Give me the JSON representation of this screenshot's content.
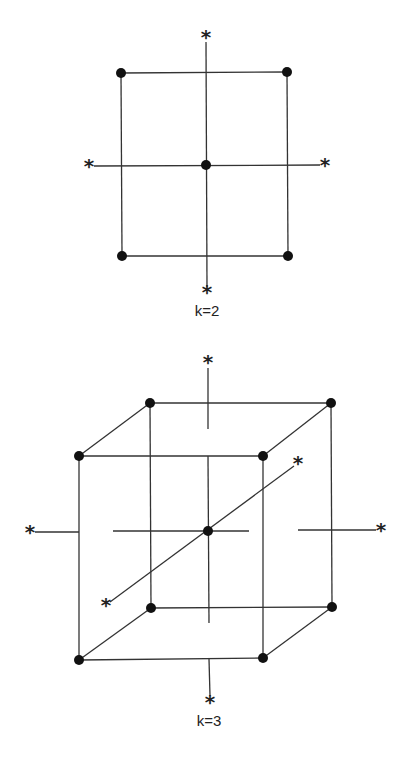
{
  "figure": {
    "colors": {
      "line": "#333333",
      "point": "#111111",
      "background": "#ffffff"
    },
    "panels": [
      {
        "id": "k2",
        "label": "k=2",
        "label_pos": [
          207,
          316
        ],
        "factorial_points": [
          [
            121,
            73
          ],
          [
            287,
            72
          ],
          [
            122,
            256
          ],
          [
            288,
            256
          ]
        ],
        "center_point": [
          206,
          165
        ],
        "axial_points": [
          [
            206,
            37
          ],
          [
            207,
            292
          ],
          [
            89,
            166
          ],
          [
            325,
            165
          ]
        ],
        "edges": [
          [
            [
              121,
              73
            ],
            [
              287,
              72
            ]
          ],
          [
            [
              287,
              72
            ],
            [
              288,
              256
            ]
          ],
          [
            [
              288,
              256
            ],
            [
              122,
              256
            ]
          ],
          [
            [
              122,
              256
            ],
            [
              121,
              73
            ]
          ],
          [
            [
              206,
              42
            ],
            [
              207,
              287
            ]
          ],
          [
            [
              94,
              166
            ],
            [
              320,
              165
            ]
          ]
        ]
      },
      {
        "id": "k3",
        "label": "k=3",
        "label_pos": [
          209,
          726
        ],
        "factorial_points": [
          [
            150,
            403
          ],
          [
            331,
            403
          ],
          [
            151,
            608
          ],
          [
            332,
            607
          ],
          [
            79,
            456
          ],
          [
            263,
            456
          ],
          [
            79,
            660
          ],
          [
            263,
            658
          ]
        ],
        "center_point": [
          208,
          531
        ],
        "axial_points": [
          [
            208,
            362
          ],
          [
            210,
            702
          ],
          [
            30,
            532
          ],
          [
            381,
            530
          ],
          [
            298,
            463
          ],
          [
            106,
            605
          ]
        ],
        "edges": [
          [
            [
              150,
              403
            ],
            [
              331,
              403
            ]
          ],
          [
            [
              331,
              403
            ],
            [
              332,
              607
            ]
          ],
          [
            [
              332,
              607
            ],
            [
              151,
              608
            ]
          ],
          [
            [
              151,
              608
            ],
            [
              150,
              403
            ]
          ],
          [
            [
              79,
              456
            ],
            [
              263,
              456
            ]
          ],
          [
            [
              263,
              456
            ],
            [
              263,
              658
            ]
          ],
          [
            [
              263,
              658
            ],
            [
              79,
              660
            ]
          ],
          [
            [
              79,
              660
            ],
            [
              79,
              456
            ]
          ],
          [
            [
              79,
              456
            ],
            [
              150,
              403
            ]
          ],
          [
            [
              263,
              456
            ],
            [
              331,
              403
            ]
          ],
          [
            [
              79,
              660
            ],
            [
              151,
              608
            ]
          ],
          [
            [
              263,
              658
            ],
            [
              332,
              607
            ]
          ],
          [
            [
              208,
              368
            ],
            [
              208,
              429
            ]
          ],
          [
            [
              208,
              456
            ],
            [
              209,
              623
            ]
          ],
          [
            [
              209,
              659
            ],
            [
              210,
              696
            ]
          ],
          [
            [
              35,
              532
            ],
            [
              79,
              532
            ]
          ],
          [
            [
              113,
              531
            ],
            [
              249,
              531
            ]
          ],
          [
            [
              298,
              530
            ],
            [
              376,
              530
            ]
          ],
          [
            [
              110,
              602
            ],
            [
              294,
              466
            ]
          ]
        ]
      }
    ]
  }
}
